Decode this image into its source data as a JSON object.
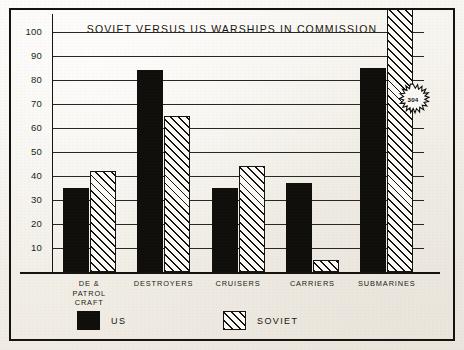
{
  "chart_data": {
    "type": "bar",
    "title": "SOVIET VERSUS US WARSHIPS IN COMMISSION",
    "xlabel": "",
    "ylabel": "",
    "ylim": [
      0,
      100
    ],
    "yticks": [
      10,
      20,
      30,
      40,
      50,
      60,
      70,
      80,
      90,
      100
    ],
    "grid": true,
    "legend_position": "bottom",
    "categories": [
      "DE &\nPATROL\nCRAFT",
      "DESTROYERS",
      "CRUISERS",
      "CARRIERS",
      "SUBMARINES"
    ],
    "series": [
      {
        "name": "US",
        "values": [
          35,
          84,
          35,
          37,
          85
        ]
      },
      {
        "name": "SOVIET",
        "values": [
          42,
          65,
          44,
          5,
          304
        ]
      }
    ],
    "annotations": [
      {
        "text": "304",
        "series": "SOVIET",
        "category": "SUBMARINES",
        "note": "value exceeds axis maximum; bar runs off top of plot"
      }
    ]
  },
  "chart": {
    "title": "SOVIET VERSUS US WARSHIPS IN COMMISSION",
    "yticks": [
      {
        "label": "100",
        "value": 100
      },
      {
        "label": "90",
        "value": 90
      },
      {
        "label": "80",
        "value": 80
      },
      {
        "label": "70",
        "value": 70
      },
      {
        "label": "60",
        "value": 60
      },
      {
        "label": "50",
        "value": 50
      },
      {
        "label": "40",
        "value": 40
      },
      {
        "label": "30",
        "value": 30
      },
      {
        "label": "20",
        "value": 20
      },
      {
        "label": "10",
        "value": 10
      }
    ],
    "categories": [
      {
        "line1": "DE &",
        "line2": "PATROL",
        "line3": "CRAFT"
      },
      {
        "line1": "DESTROYERS",
        "line2": "",
        "line3": ""
      },
      {
        "line1": "CRUISERS",
        "line2": "",
        "line3": ""
      },
      {
        "line1": "CARRIERS",
        "line2": "",
        "line3": ""
      },
      {
        "line1": "SUBMARINES",
        "line2": "",
        "line3": ""
      }
    ],
    "callout": {
      "value": "304"
    },
    "legend": [
      {
        "label": "US"
      },
      {
        "label": "SOVIET"
      }
    ],
    "colors": {
      "ink": "#15120f",
      "us_fill": "#100e0b",
      "soviet_fill": "#fbfaf7",
      "paper": "#f4f1ea"
    }
  }
}
